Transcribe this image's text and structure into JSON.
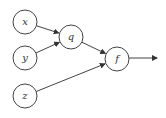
{
  "diagram": {
    "type": "computational-graph",
    "stroke_color": "#444444",
    "nodes": [
      {
        "id": "x",
        "label": "x",
        "cx": 25,
        "cy": 22,
        "r": 12
      },
      {
        "id": "y",
        "label": "y",
        "cx": 25,
        "cy": 58,
        "r": 12
      },
      {
        "id": "z",
        "label": "z",
        "cx": 25,
        "cy": 96,
        "r": 12
      },
      {
        "id": "q",
        "label": "q",
        "cx": 71,
        "cy": 37,
        "r": 12
      },
      {
        "id": "f",
        "label": "f",
        "cx": 117,
        "cy": 59,
        "r": 12
      }
    ],
    "edges": [
      {
        "from": "x",
        "to": "q"
      },
      {
        "from": "y",
        "to": "q"
      },
      {
        "from": "q",
        "to": "f"
      },
      {
        "from": "z",
        "to": "f"
      },
      {
        "from": "f",
        "to": "output"
      }
    ],
    "output_arrow": {
      "x1": 129,
      "y1": 58,
      "x2": 157,
      "y2": 58
    }
  }
}
